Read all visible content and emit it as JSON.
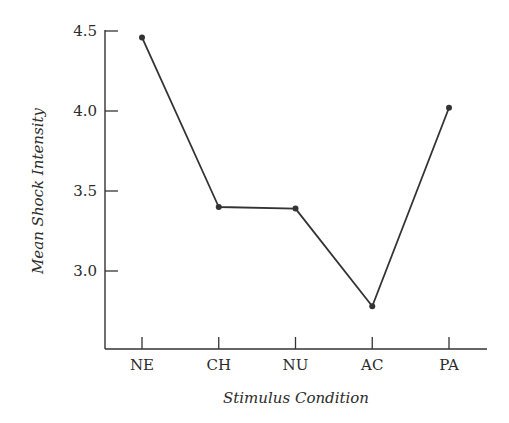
{
  "chart_data": {
    "type": "line",
    "title": "",
    "xlabel": "Stimulus Condition",
    "ylabel": "Mean Shock Intensity",
    "categories": [
      "NE",
      "CH",
      "NU",
      "AC",
      "PA"
    ],
    "values": [
      4.46,
      3.4,
      3.39,
      2.78,
      4.02
    ],
    "yticks": [
      "3.0",
      "3.5",
      "4.0",
      "4.5"
    ],
    "ytick_values": [
      3.0,
      3.5,
      4.0,
      4.5
    ],
    "ylim": [
      2.52,
      4.5
    ],
    "grid": false,
    "legend": null,
    "markers": true,
    "line_color": "#333333"
  }
}
